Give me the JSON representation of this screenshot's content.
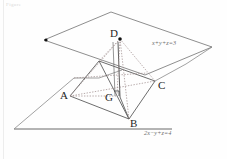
{
  "figure": {
    "title_artifact": "Figure",
    "planes": [
      {
        "id": "upper-plane",
        "equation": "x+y+z=3",
        "equation_label_pos": {
          "x": 152,
          "y": 41
        }
      },
      {
        "id": "lower-plane",
        "equation": "2x−y+z=4",
        "equation_label_pos": {
          "x": 144,
          "y": 131
        }
      }
    ],
    "vertices": [
      {
        "name": "A",
        "label": "A",
        "point": {
          "x": 70,
          "y": 96
        },
        "label_pos": {
          "x": 62,
          "y": 90
        }
      },
      {
        "name": "B",
        "label": "B",
        "point": {
          "x": 129,
          "y": 119
        },
        "label_pos": {
          "x": 130,
          "y": 118
        }
      },
      {
        "name": "C",
        "label": "C",
        "point": {
          "x": 155,
          "y": 81
        },
        "label_pos": {
          "x": 157,
          "y": 80
        }
      },
      {
        "name": "D",
        "label": "D",
        "point": {
          "x": 120,
          "y": 39
        },
        "label_pos": {
          "x": 110,
          "y": 29
        }
      },
      {
        "name": "G",
        "label": "G",
        "point": {
          "x": 117,
          "y": 96
        },
        "label_pos": {
          "x": 107,
          "y": 92
        }
      }
    ],
    "marks": {
      "right_angle_at": "G",
      "point_marker_at": "D",
      "point_marker_left": {
        "x": 46,
        "y": 40
      }
    },
    "colors": {
      "stroke": "#6f6f6f",
      "stroke_dark": "#4a4a4a",
      "dotted": "#9a8f8f",
      "label": "#1e1e1e",
      "equation": "#6d6d6d",
      "background": "#fefefe"
    }
  }
}
